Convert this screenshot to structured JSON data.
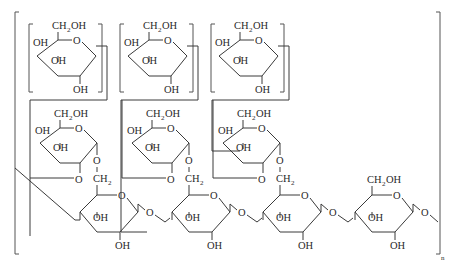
{
  "diagram": {
    "type": "chemical-structure",
    "labels": {
      "ch2oh": "CH",
      "ch2oh_sub": "2",
      "ch2oh_tail": "OH",
      "oh": "OH",
      "o": "O",
      "ch2": "CH",
      "ch2_sub": "2",
      "repeat": "n"
    },
    "top_row_units": 3,
    "middle_row_units": 3,
    "backbone_units": 4,
    "colors": {
      "line": "#3a3a3a",
      "text": "#2a2a2a",
      "background": "#ffffff"
    }
  }
}
